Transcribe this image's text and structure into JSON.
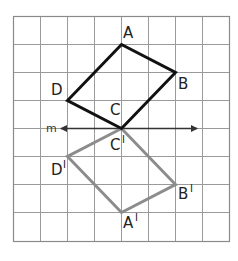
{
  "diagram": {
    "type": "reflection",
    "grid": {
      "columns": 8,
      "rows": 8,
      "line_color": "#9a9a9a",
      "border_color": "#8a8a8a"
    },
    "line_m": {
      "label": "m",
      "color": "#333333",
      "arrows": "both"
    },
    "original": {
      "color": "#111111",
      "vertices": [
        {
          "name": "A",
          "label": "A",
          "grid": [
            4,
            1
          ]
        },
        {
          "name": "B",
          "label": "B",
          "grid": [
            6,
            2
          ]
        },
        {
          "name": "C",
          "label": "C",
          "grid": [
            4,
            4
          ]
        },
        {
          "name": "D",
          "label": "D",
          "grid": [
            2,
            3
          ]
        }
      ]
    },
    "image": {
      "color": "#8c8c8c",
      "prime_mark": "I",
      "vertices": [
        {
          "name": "A'",
          "label": "A",
          "grid": [
            4,
            7
          ]
        },
        {
          "name": "B'",
          "label": "B",
          "grid": [
            6,
            6
          ]
        },
        {
          "name": "C'",
          "label": "C",
          "grid": [
            4,
            4
          ]
        },
        {
          "name": "D'",
          "label": "D",
          "grid": [
            2,
            5
          ]
        }
      ]
    }
  }
}
